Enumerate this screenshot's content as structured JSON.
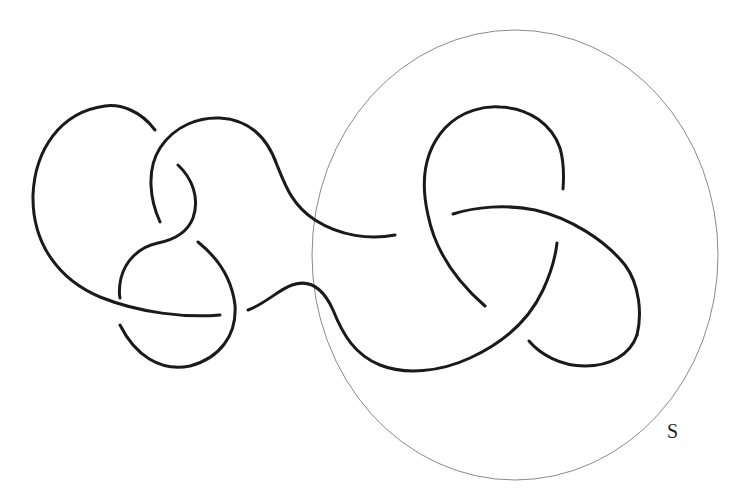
{
  "figure": {
    "type": "knot diagram",
    "colors": {
      "strand": "#1a1a1a",
      "sphere": "#8a8a8a",
      "background": "#ffffff",
      "label": "#222222"
    },
    "sphere": {
      "label": "S",
      "center": [
        515,
        255
      ],
      "radii": [
        203,
        225
      ]
    },
    "strands": [
      {
        "id": "left-outer-arc"
      },
      {
        "id": "upper-middle-loop"
      },
      {
        "id": "middle-s-curve"
      },
      {
        "id": "lower-left-arc"
      },
      {
        "id": "lower-small-arc"
      },
      {
        "id": "connector-wave"
      },
      {
        "id": "trefoil-top-loop"
      },
      {
        "id": "trefoil-right-band"
      },
      {
        "id": "trefoil-lower-right-arc"
      }
    ]
  }
}
